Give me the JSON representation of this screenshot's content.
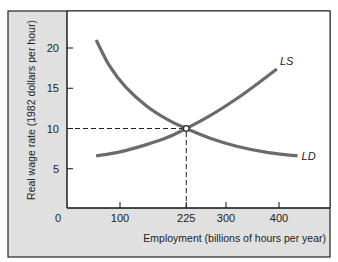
{
  "chart_data": {
    "type": "line",
    "title": "",
    "xlabel": "Employment (billions of hours per year)",
    "ylabel": "Real wage rate (1982 dollars per hour)",
    "xlim": [
      0,
      495
    ],
    "ylim": [
      0,
      24
    ],
    "x_ticks": [
      0,
      100,
      225,
      300,
      400
    ],
    "y_ticks": [
      5,
      10,
      15,
      20
    ],
    "origin_label": "0",
    "grid": false,
    "series": [
      {
        "name": "LD",
        "label": "LD",
        "description": "Labor demand (downward sloping)",
        "points": [
          [
            55,
            21
          ],
          [
            80,
            17.8
          ],
          [
            110,
            15.2
          ],
          [
            150,
            12.8
          ],
          [
            190,
            11.1
          ],
          [
            225,
            10
          ],
          [
            270,
            8.8
          ],
          [
            320,
            7.8
          ],
          [
            380,
            7.0
          ],
          [
            435,
            6.6
          ]
        ]
      },
      {
        "name": "LS",
        "label": "LS",
        "description": "Labor supply (upward sloping)",
        "points": [
          [
            55,
            6.6
          ],
          [
            100,
            7.1
          ],
          [
            150,
            8.0
          ],
          [
            190,
            8.9
          ],
          [
            225,
            10
          ],
          [
            270,
            11.6
          ],
          [
            320,
            13.7
          ],
          [
            360,
            15.6
          ],
          [
            396,
            17.4
          ]
        ]
      }
    ],
    "equilibrium": {
      "x": 225,
      "y": 10,
      "marker": "open-circle"
    },
    "reference_lines": [
      {
        "type": "horizontal-dashed",
        "y": 10,
        "from_x": 0,
        "to_x": 225
      },
      {
        "type": "vertical-dashed",
        "x": 225,
        "from_y": 0,
        "to_y": 10
      }
    ],
    "colors": {
      "curve": "#6b6b6b",
      "panel_background": "#e0e0e0",
      "plot_background": "#ffffff",
      "axis": "#111111"
    }
  }
}
